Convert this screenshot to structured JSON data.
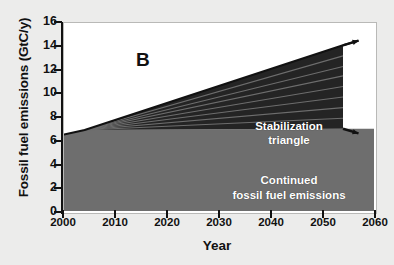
{
  "figure": {
    "panel_label": "B"
  },
  "axes": {
    "y_title": "Fossil fuel emissions (GtC/y)",
    "x_title": "Year",
    "y_ticks": [
      "0",
      "2",
      "4",
      "6",
      "8",
      "10",
      "12",
      "14",
      "16"
    ],
    "x_ticks": [
      "2000",
      "2010",
      "2020",
      "2030",
      "2040",
      "2050",
      "2060"
    ]
  },
  "annotations": {
    "wedge_line1": "Stabilization",
    "wedge_line2": "triangle",
    "continued_line1": "Continued",
    "continued_line2": "fossil fuel emissions"
  },
  "colors": {
    "triangle_fill": "#242424",
    "triangle_line": "#6d6d6d",
    "continued_fill": "#6e6e6e",
    "plot_bg": "#ffffff",
    "axis": "#111111",
    "page_bg": "#ececeb",
    "label_text": "#ffffff"
  },
  "chart_data": {
    "type": "area",
    "title": "",
    "subtitle": "",
    "xlabel": "Year",
    "ylabel": "Fossil fuel emissions (GtC/y)",
    "xlim": [
      2000,
      2060
    ],
    "ylim": [
      0,
      16
    ],
    "xtick_values": [
      2000,
      2010,
      2020,
      2030,
      2040,
      2050,
      2060
    ],
    "ytick_values": [
      0,
      2,
      4,
      6,
      8,
      10,
      12,
      14,
      16
    ],
    "grid": false,
    "legend": false,
    "series": [
      {
        "name": "Continued fossil fuel emissions",
        "kind": "area_filled",
        "fill": "#6e6e6e",
        "x": [
          2000,
          2004,
          2054,
          2057,
          2060
        ],
        "y": [
          6.5,
          6.9,
          7.0,
          7.0,
          7.0
        ],
        "note": "Flat path held at about 7 GtC/y; filled from 0 up to the curve"
      },
      {
        "name": "Stabilization triangle (upper boundary)",
        "kind": "line",
        "fill": "#242424",
        "x": [
          2000,
          2004,
          2054,
          2057
        ],
        "y": [
          6.5,
          6.9,
          14.1,
          14.5
        ],
        "note": "Business-as-usual growth path; triangle lies between this and the flat path"
      }
    ],
    "triangle": {
      "apex_x": 2004,
      "apex_y": 6.9,
      "right_top_x": 2054,
      "right_top_y": 14.1,
      "right_bottom_x": 2054,
      "right_bottom_y": 7.0,
      "wedge_count": 8,
      "divider_count": 7,
      "dividers_right_edge_y": [
        7.9,
        8.8,
        9.7,
        10.6,
        11.5,
        12.3,
        13.2
      ]
    },
    "arrows": [
      {
        "name": "upper-growth-arrow",
        "from": [
          2054,
          14.1
        ],
        "to": [
          2057,
          14.5
        ]
      },
      {
        "name": "lower-flat-arrow",
        "from": [
          2054,
          7.0
        ],
        "to": [
          2057,
          6.6
        ]
      }
    ],
    "annotations": [
      {
        "text": "B",
        "x": 2002,
        "y": 15.3
      },
      {
        "text": "Stabilization triangle",
        "x": 2032,
        "y": 10.2
      },
      {
        "text": "Continued fossil fuel emissions",
        "x": 2030,
        "y": 4.3
      }
    ]
  }
}
